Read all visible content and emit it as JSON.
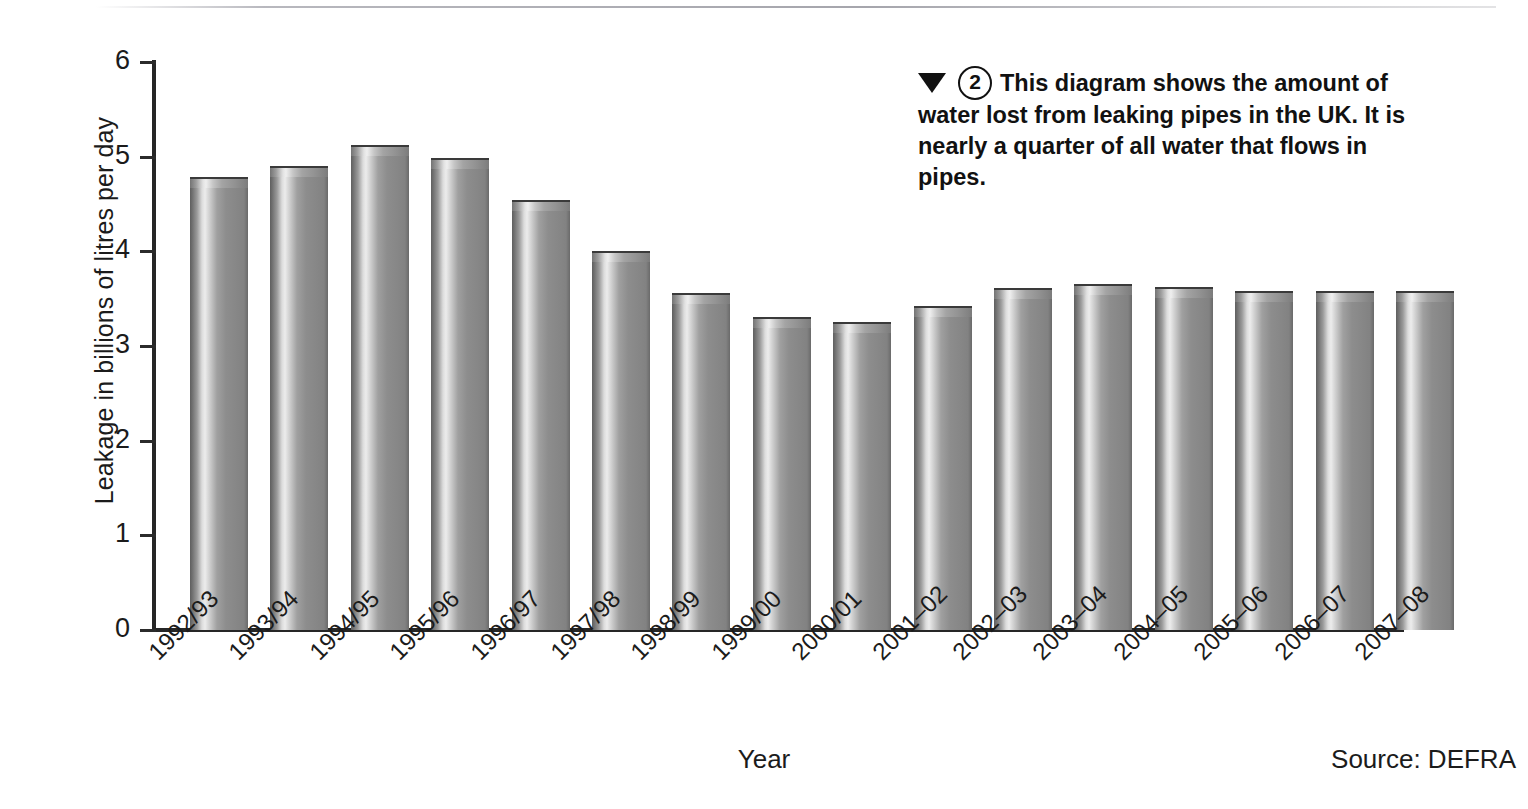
{
  "chart_data": {
    "type": "bar",
    "title": "",
    "xlabel": "Year",
    "ylabel": "Leakage in billions of litres per day",
    "ylim": [
      0,
      6
    ],
    "ytick_labels": [
      "6",
      "5",
      "4",
      "3",
      "2",
      "1",
      "0"
    ],
    "yticks": [
      6,
      5,
      4,
      3,
      2,
      1,
      0
    ],
    "grid": false,
    "legend": null,
    "categories": [
      "1992/93",
      "1993/94",
      "1994/95",
      "1995/96",
      "1996/97",
      "1997/98",
      "1998/99",
      "1999/00",
      "2000/01",
      "2001–02",
      "2002–03",
      "2003–04",
      "2004–05",
      "2005–06",
      "2006–07",
      "2007–08"
    ],
    "values": [
      4.78,
      4.9,
      5.12,
      4.99,
      4.54,
      4.0,
      3.56,
      3.31,
      3.25,
      3.42,
      3.61,
      3.66,
      3.62,
      3.58,
      3.58,
      3.58
    ],
    "bar_color": "#8a8a8a",
    "bar_highlight_color": "#ececec",
    "bar_edge_color": "#5f5f5f",
    "axis_color": "#262626",
    "source": "Source: DEFRA"
  },
  "caption": {
    "marker_icon": "down-triangle-icon",
    "number": "2",
    "text": "This diagram shows the amount of water lost from leaking pipes in the UK. It is nearly a quarter of all water that flows in pipes."
  },
  "axes": {
    "x_title": "Year",
    "y_title": "Leakage in billions of litres per day"
  },
  "footer": {
    "source": "Source: DEFRA"
  }
}
